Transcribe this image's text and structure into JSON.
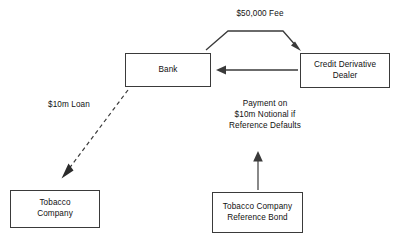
{
  "diagram": {
    "background_color": "#ffffff",
    "stroke_color": "#3a3a3a",
    "text_color": "#111111",
    "nodes": [
      {
        "id": "bank",
        "label": "Bank"
      },
      {
        "id": "dealer",
        "label": "Credit Derivative\nDealer",
        "line1": "Credit Derivative",
        "line2": "Dealer"
      },
      {
        "id": "tobacco",
        "label": "Tobacco\nCompany",
        "line1": "Tobacco",
        "line2": "Company"
      },
      {
        "id": "refbond",
        "label": "Tobacco Company\nReference Bond",
        "line1": "Tobacco Company",
        "line2": "Reference Bond"
      }
    ],
    "edges": [
      {
        "id": "fee",
        "label": "$50,000 Fee",
        "from": "bank",
        "to": "dealer",
        "style": "solid",
        "arrow": "end"
      },
      {
        "id": "payment",
        "label": "Payment on $10m Notional if Reference Defaults",
        "line1": "Payment on",
        "line2": "$10m Notional if",
        "line3": "Reference Defaults",
        "from": "dealer",
        "to": "bank",
        "style": "solid",
        "arrow": "end"
      },
      {
        "id": "loan",
        "label": "$10m Loan",
        "from": "bank",
        "to": "tobacco",
        "style": "dashed",
        "arrow": "end"
      },
      {
        "id": "reference",
        "label": "",
        "from": "refbond",
        "to": "payment",
        "style": "solid",
        "arrow": "end"
      }
    ]
  }
}
